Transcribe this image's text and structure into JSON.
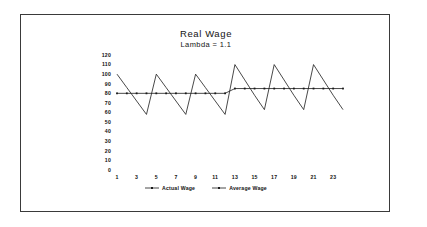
{
  "chart_data": {
    "type": "line",
    "title": "Real Wage",
    "subtitle": "Lambda = 1.1",
    "xlabel": "",
    "ylabel": "",
    "xlim": [
      1,
      24
    ],
    "ylim": [
      0,
      120
    ],
    "grid": false,
    "legend_position": "bottom",
    "yticks": [
      0,
      10,
      20,
      30,
      40,
      50,
      60,
      70,
      80,
      90,
      100,
      110,
      120
    ],
    "ytick_labels": [
      "0",
      "10",
      "20",
      "30",
      "40",
      "50",
      "60",
      "70",
      "80",
      "90",
      "100",
      "110",
      "120"
    ],
    "xticks": [
      1,
      3,
      5,
      7,
      9,
      11,
      13,
      15,
      17,
      19,
      21,
      23
    ],
    "xtick_labels": [
      "1",
      "3",
      "5",
      "7",
      "9",
      "11",
      "13",
      "15",
      "17",
      "19",
      "21",
      "23"
    ],
    "x": [
      1,
      2,
      3,
      4,
      5,
      6,
      7,
      8,
      9,
      10,
      11,
      12,
      13,
      14,
      15,
      16,
      17,
      18,
      19,
      20,
      21,
      22,
      23,
      24
    ],
    "series": [
      {
        "name": "Actual Wage",
        "marker": "none",
        "values": [
          100,
          86,
          72,
          58,
          100,
          86,
          72,
          58,
          100,
          86,
          72,
          58,
          110,
          94,
          78,
          63,
          110,
          94,
          78,
          63,
          110,
          94,
          78,
          63
        ]
      },
      {
        "name": "Average Wage",
        "marker": "dot",
        "values": [
          80,
          80,
          80,
          80,
          80,
          80,
          80,
          80,
          80,
          80,
          80,
          80,
          85,
          85,
          85,
          85,
          85,
          85,
          85,
          85,
          85,
          85,
          85,
          85
        ]
      }
    ]
  },
  "legend": {
    "entries": [
      {
        "label": "Actual Wage"
      },
      {
        "label": "Average Wage"
      }
    ]
  }
}
